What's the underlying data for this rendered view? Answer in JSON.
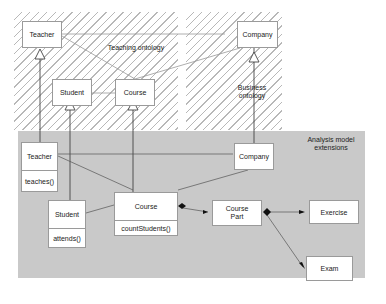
{
  "regions": {
    "teaching": {
      "label": "Teaching ontology"
    },
    "business": {
      "label_line1": "Business",
      "label_line2": "ontology"
    },
    "analysis": {
      "label_line1": "Analysis model",
      "label_line2": "extensions"
    }
  },
  "ontology_classes": {
    "teacher": "Teacher",
    "student": "Student",
    "course": "Course",
    "company": "Company"
  },
  "analysis_classes": {
    "teacher": {
      "name": "Teacher",
      "operation": "teaches()"
    },
    "student": {
      "name": "Student",
      "operation": "attends()"
    },
    "course": {
      "name": "Course",
      "operation": "countStudents()"
    },
    "company": {
      "name": "Company"
    },
    "course_part": {
      "name_line1": "Course",
      "name_line2": "Part"
    },
    "exercise": {
      "name": "Exercise"
    },
    "exam": {
      "name": "Exam"
    }
  },
  "colors": {
    "hatch": "#b8b8b8",
    "analysis_fill": "#c9c9c9",
    "box_border": "#9a9a9a",
    "line": "#555555"
  }
}
